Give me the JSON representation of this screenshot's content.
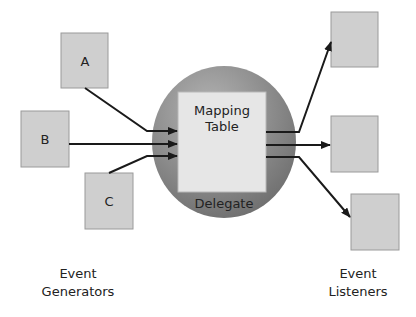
{
  "generators": [
    {
      "label": "A"
    },
    {
      "label": "B"
    },
    {
      "label": "C"
    }
  ],
  "listeners": [
    {
      "label": ""
    },
    {
      "label": ""
    },
    {
      "label": ""
    }
  ],
  "delegate": {
    "label": "Delegate",
    "table_line1": "Mapping",
    "table_line2": "Table"
  },
  "captions": {
    "left_line1": "Event",
    "left_line2": "Generators",
    "right_line1": "Event",
    "right_line2": "Listeners"
  },
  "colors": {
    "box_fill": "#cfcfcf",
    "box_stroke": "#9a9a9a",
    "delegate_fill": "#8a8a8a",
    "table_fill": "#e6e6e6",
    "arrow": "#1a1a1a"
  }
}
